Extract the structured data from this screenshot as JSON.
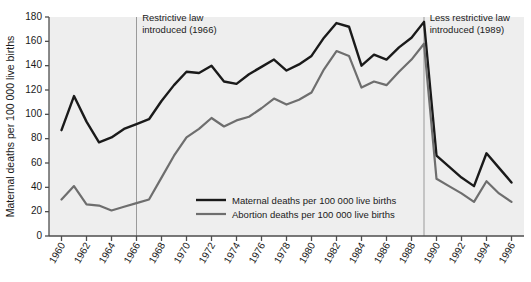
{
  "chart_data": {
    "type": "line",
    "title": "",
    "xlabel": "",
    "ylabel": "Maternal deaths per 100 000 live births",
    "ylim": [
      0,
      180
    ],
    "ytick_values": [
      0,
      20,
      40,
      60,
      80,
      100,
      120,
      140,
      160,
      180
    ],
    "ytick_labels": [
      "0",
      "20",
      "40",
      "60",
      "80",
      "100",
      "120",
      "140",
      "160",
      "180"
    ],
    "xlim": [
      1959,
      1997
    ],
    "xtick_values": [
      1960,
      1962,
      1964,
      1966,
      1968,
      1970,
      1972,
      1974,
      1976,
      1978,
      1980,
      1982,
      1984,
      1986,
      1988,
      1990,
      1992,
      1994,
      1996
    ],
    "xtick_labels": [
      "1960",
      "1962",
      "1964",
      "1966",
      "1968",
      "1970",
      "1972",
      "1974",
      "1976",
      "1978",
      "1980",
      "1982",
      "1984",
      "1986",
      "1988",
      "1990",
      "1992",
      "1994",
      "1996"
    ],
    "grid": false,
    "legend_position": "inside-bottom-center",
    "x": [
      1960,
      1961,
      1962,
      1963,
      1964,
      1965,
      1966,
      1967,
      1968,
      1969,
      1970,
      1971,
      1972,
      1973,
      1974,
      1975,
      1976,
      1977,
      1978,
      1979,
      1980,
      1981,
      1982,
      1983,
      1984,
      1985,
      1986,
      1987,
      1988,
      1989,
      1990,
      1991,
      1992,
      1993,
      1994,
      1995,
      1996
    ],
    "series": [
      {
        "name": "Maternal deaths per 100 000 live births",
        "color": "#1a1a1a",
        "width": 2.4,
        "values": [
          87,
          115,
          94,
          77,
          81,
          88,
          92,
          96,
          111,
          124,
          135,
          134,
          140,
          127,
          125,
          133,
          139,
          145,
          136,
          141,
          148,
          163,
          175,
          172,
          140,
          149,
          145,
          155,
          163,
          176,
          66,
          57,
          48,
          41,
          68,
          56,
          44
        ]
      },
      {
        "name": "Abortion deaths per 100 000 live births",
        "color": "#6e6e6e",
        "width": 2.2,
        "values": [
          30,
          41,
          26,
          25,
          21,
          24,
          27,
          30,
          48,
          66,
          81,
          88,
          97,
          90,
          95,
          98,
          105,
          113,
          108,
          112,
          118,
          137,
          152,
          148,
          122,
          127,
          124,
          135,
          145,
          158,
          47,
          41,
          35,
          28,
          45,
          35,
          28
        ]
      }
    ],
    "annotations": [
      {
        "name": "restrictive-law",
        "x": 1966,
        "lines": [
          "Restrictive law",
          "introduced (1966)"
        ],
        "label_x": 1966.45,
        "label_y": 177,
        "line_color": "#9a9a9a"
      },
      {
        "name": "less-restrictive-law",
        "x": 1989,
        "lines": [
          "Less restrictive law",
          "introduced (1989)"
        ],
        "label_x": 1989.45,
        "label_y": 177,
        "line_color": "#9a9a9a"
      }
    ],
    "legend": [
      {
        "label": "Maternal deaths per 100 000 live births",
        "color": "#1a1a1a",
        "width": 2.4
      },
      {
        "label": "Abortion deaths per 100 000 live births",
        "color": "#6e6e6e",
        "width": 2.2
      }
    ],
    "plot_background": "#eeeeee",
    "axis_color": "#4d4d4d",
    "figure_background": "#ffffff"
  }
}
